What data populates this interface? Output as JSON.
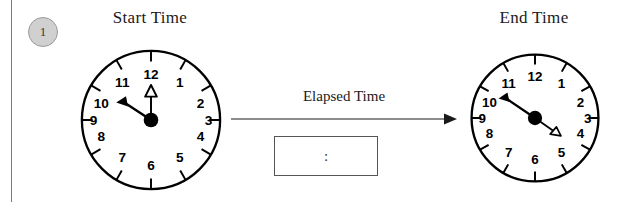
{
  "problem": {
    "number": "1"
  },
  "start_clock": {
    "title": "Start Time",
    "hour": 12,
    "minute": 50,
    "numerals": [
      "12",
      "1",
      "2",
      "3",
      "4",
      "5",
      "6",
      "7",
      "8",
      "9",
      "10",
      "11"
    ],
    "hour_hand_angle_deg": 295,
    "minute_hand_angle_deg": 300,
    "hand_colors": {
      "minute": "#000000",
      "hour": "#000000"
    }
  },
  "end_clock": {
    "title": "End Time",
    "hour": 3,
    "minute": 50,
    "numerals": [
      "12",
      "1",
      "2",
      "3",
      "4",
      "5",
      "6",
      "7",
      "8",
      "9",
      "10",
      "11"
    ],
    "hour_hand_angle_deg": 115,
    "minute_hand_angle_deg": 300,
    "hand_colors": {
      "minute": "#000000",
      "hour": "#000000"
    }
  },
  "elapsed": {
    "label": "Elapsed Time",
    "answer_value": ":",
    "answer_placeholder": ":"
  },
  "colors": {
    "ink": "#000000",
    "rule": "#7d7d7d",
    "badge_fill": "#d0d0d0",
    "badge_stroke": "#9a9a9a",
    "box_stroke": "#555555",
    "arrow": "#666666"
  }
}
